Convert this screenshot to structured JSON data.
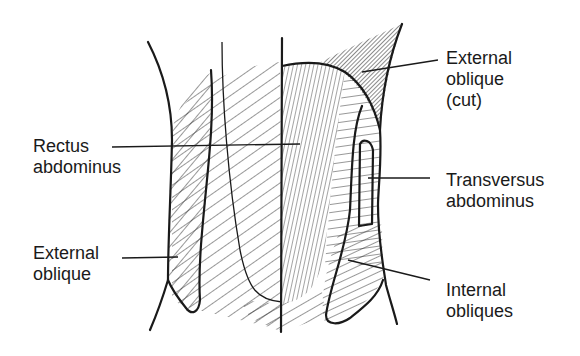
{
  "colors": {
    "ink": "#1a1a1a",
    "background": "#ffffff",
    "cut_fill": "#8a8a8a"
  },
  "labels": [
    {
      "id": "external-oblique-cut",
      "text": "External\noblique\n(cut)"
    },
    {
      "id": "rectus-abdominus",
      "text": "Rectus\nabdominus"
    },
    {
      "id": "transversus-abdominus",
      "text": "Transversus\nabdominus"
    },
    {
      "id": "external-oblique",
      "text": "External\noblique"
    },
    {
      "id": "internal-obliques",
      "text": "Internal\nobliques"
    }
  ]
}
